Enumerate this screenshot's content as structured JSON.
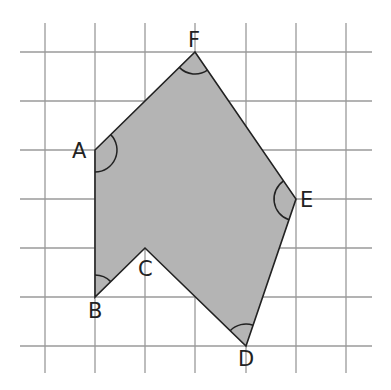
{
  "diagram": {
    "type": "polygon-on-grid",
    "grid": {
      "cols_x": [
        45,
        95,
        145,
        195,
        246,
        296,
        346
      ],
      "rows_y": [
        52,
        101,
        150,
        199,
        248,
        297,
        346
      ],
      "x_extent": [
        20,
        372
      ],
      "y_extent": [
        23,
        373
      ],
      "line_color": "#9a9a9a"
    },
    "polygon": {
      "fill": "#b4b4b4",
      "stroke": "#222222",
      "vertex_order": [
        "A",
        "B",
        "C",
        "D",
        "E",
        "F"
      ]
    },
    "vertices": {
      "A": {
        "label": "A",
        "x": 95,
        "y": 150,
        "grid": [
          1,
          2
        ],
        "label_x": 72,
        "label_y": 158,
        "angle_marked": true
      },
      "B": {
        "label": "B",
        "x": 95,
        "y": 297,
        "grid": [
          1,
          5
        ],
        "label_x": 88,
        "label_y": 318,
        "angle_marked": true
      },
      "C": {
        "label": "C",
        "x": 145,
        "y": 248,
        "grid": [
          2,
          4
        ],
        "label_x": 138,
        "label_y": 276,
        "angle_marked": false
      },
      "D": {
        "label": "D",
        "x": 246,
        "y": 346,
        "grid": [
          4,
          6
        ],
        "label_x": 238,
        "label_y": 366,
        "angle_marked": true
      },
      "E": {
        "label": "E",
        "x": 296,
        "y": 199,
        "grid": [
          5,
          3
        ],
        "label_x": 300,
        "label_y": 207,
        "angle_marked": true
      },
      "F": {
        "label": "F",
        "x": 195,
        "y": 52,
        "grid": [
          3,
          0
        ],
        "label_x": 188,
        "label_y": 47,
        "angle_marked": true
      }
    }
  }
}
